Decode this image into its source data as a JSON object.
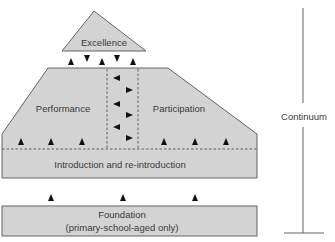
{
  "diagram": {
    "levels": {
      "excellence": {
        "label": "Excellence"
      },
      "performance": {
        "label": "Performance"
      },
      "participation": {
        "label": "Participation"
      },
      "introduction": {
        "label": "Introduction and re-introduction"
      },
      "foundation": {
        "label_line1": "Foundation",
        "label_line2": "(primary-school-aged only)"
      }
    },
    "continuum": {
      "label": "Continuum"
    },
    "colors": {
      "fill": "#d3d3d3",
      "stroke": "#555555",
      "arrow": "#111111",
      "text": "#3a3a3a"
    },
    "arrows": {
      "excellence_link": [
        "up",
        "down",
        "up",
        "down",
        "up"
      ],
      "performance_participation_exchange": [
        "left",
        "right",
        "left",
        "right",
        "left",
        "right"
      ],
      "introduction_to_performance": [
        "up",
        "up",
        "up"
      ],
      "introduction_to_participation": [
        "up",
        "up",
        "up"
      ],
      "foundation_to_introduction": [
        "up",
        "up",
        "up"
      ]
    }
  }
}
